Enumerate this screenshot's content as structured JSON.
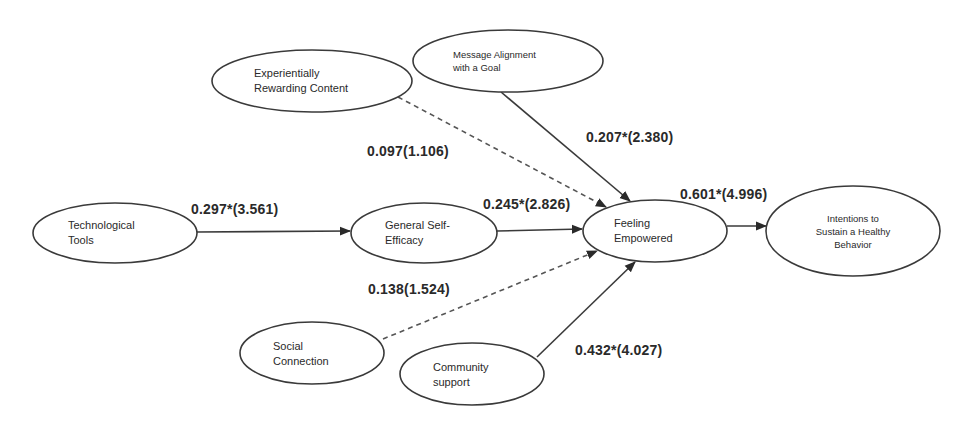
{
  "diagram": {
    "type": "structural-equation-model",
    "nodes": {
      "technological_tools": {
        "line1": "Technological",
        "line2": "Tools"
      },
      "experiential_content": {
        "line1": "Experientially",
        "line2": "Rewarding Content"
      },
      "message_alignment": {
        "line1": "Message Alignment",
        "line2": "with a Goal"
      },
      "general_self_efficacy": {
        "line1": "General Self-",
        "line2": "Efficacy"
      },
      "feeling_empowered": {
        "line1": "Feeling",
        "line2": "Empowered"
      },
      "intentions": {
        "line1": "Intentions to",
        "line2": "Sustain a Healthy",
        "line3": "Behavior"
      },
      "social_connection": {
        "line1": "Social",
        "line2": "Connection"
      },
      "community_support": {
        "line1": "Community",
        "line2": "support"
      }
    },
    "edges": [
      {
        "from": "Technological Tools",
        "to": "General Self-Efficacy",
        "label": "0.297*(3.561)",
        "style": "solid"
      },
      {
        "from": "Experientially Rewarding Content",
        "to": "Feeling Empowered",
        "label": "0.097(1.106)",
        "style": "dashed"
      },
      {
        "from": "Message Alignment with a Goal",
        "to": "Feeling Empowered",
        "label": "0.207*(2.380)",
        "style": "solid"
      },
      {
        "from": "General Self-Efficacy",
        "to": "Feeling Empowered",
        "label": "0.245*(2.826)",
        "style": "solid"
      },
      {
        "from": "Social Connection",
        "to": "Feeling Empowered",
        "label": "0.138(1.524)",
        "style": "dashed"
      },
      {
        "from": "Community support",
        "to": "Feeling Empowered",
        "label": "0.432*(4.027)",
        "style": "solid"
      },
      {
        "from": "Feeling Empowered",
        "to": "Intentions to Sustain a Healthy Behavior",
        "label": "0.601*(4.996)",
        "style": "solid"
      }
    ],
    "colors": {
      "stroke": "#3a3a3a",
      "text": "#2a2a2a",
      "background": "#ffffff"
    }
  }
}
